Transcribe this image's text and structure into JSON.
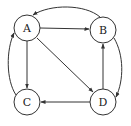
{
  "diagram": {
    "type": "directed-graph",
    "nodes": [
      {
        "id": "A",
        "label": "A",
        "x": 27,
        "y": 28
      },
      {
        "id": "B",
        "label": "B",
        "x": 103,
        "y": 30
      },
      {
        "id": "C",
        "label": "C",
        "x": 27,
        "y": 102
      },
      {
        "id": "D",
        "label": "D",
        "x": 103,
        "y": 102
      }
    ],
    "edges": [
      {
        "from": "A",
        "to": "B",
        "style": "straight"
      },
      {
        "from": "A",
        "to": "C",
        "style": "straight"
      },
      {
        "from": "A",
        "to": "D",
        "style": "straight"
      },
      {
        "from": "D",
        "to": "B",
        "style": "straight"
      },
      {
        "from": "D",
        "to": "C",
        "style": "straight"
      },
      {
        "from": "B",
        "to": "A",
        "style": "curved-top"
      },
      {
        "from": "C",
        "to": "A",
        "style": "curved-left"
      },
      {
        "from": "B",
        "to": "D",
        "style": "curved-right"
      }
    ],
    "colors": {
      "stroke": "#333333",
      "fill": "#ffffff",
      "text": "#222222"
    }
  }
}
